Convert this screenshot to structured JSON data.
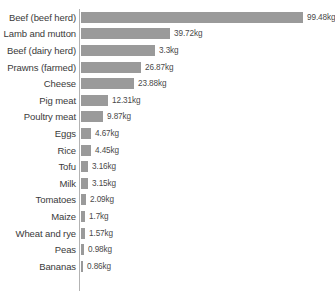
{
  "chart_data": {
    "type": "bar",
    "orientation": "horizontal",
    "title": "",
    "subtitle": "",
    "xlabel": "",
    "ylabel": "",
    "unit": "kg",
    "grid": false,
    "legend": false,
    "axis_visible": true,
    "bar_color": "#9a9a9a",
    "axis_color": "#b3b3b3",
    "background_color": "#ffffff",
    "label_color": "#3a3a3a",
    "value_color": "#4a4a4a",
    "xlim": [
      0,
      99.48
    ],
    "categories": [
      "Beef (beef herd)",
      "Lamb and mutton",
      "Beef (dairy herd)",
      "Prawns (farmed)",
      "Cheese",
      "Pig meat",
      "Poultry meat",
      "Eggs",
      "Rice",
      "Tofu",
      "Milk",
      "Tomatoes",
      "Maize",
      "Wheat and rye",
      "Peas",
      "Bananas"
    ],
    "values": [
      99.48,
      39.72,
      33.3,
      26.87,
      23.88,
      12.31,
      9.87,
      4.67,
      4.45,
      3.16,
      3.15,
      2.09,
      1.7,
      1.57,
      0.98,
      0.86
    ],
    "value_labels": [
      "99.48kg",
      "39.72kg",
      "3.3kg",
      "26.87kg",
      "23.88kg",
      "12.31kg",
      "9.87kg",
      "4.67kg",
      "4.45kg",
      "3.16kg",
      "3.15kg",
      "2.09kg",
      "1.7kg",
      "1.57kg",
      "0.98kg",
      "0.86kg"
    ],
    "bar_pixel_widths": [
      222,
      89,
      74,
      60,
      53,
      27,
      22,
      10,
      10,
      7,
      7,
      5,
      4,
      4,
      3,
      2
    ]
  }
}
